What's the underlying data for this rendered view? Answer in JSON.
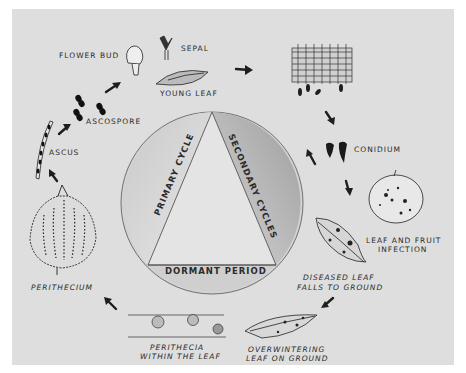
{
  "diagram": {
    "background": "#dedede",
    "ink": "#1e1e1e",
    "center": {
      "primary": "PRIMARY CYCLE",
      "secondary": "SECONDARY CYCLES",
      "dormant": "DORMANT PERIOD"
    },
    "stages": {
      "flower_bud": "FLOWER BUD",
      "sepal": "SEPAL",
      "young_leaf": "YOUNG LEAF",
      "ascospore": "ASCOSPORE",
      "ascus": "ASCUS",
      "perithecium": "PERITHECIUM",
      "perithecia_line1": "PERITHECIA",
      "perithecia_line2": "WITHIN THE LEAF",
      "overwintering_line1": "OVERWINTERING",
      "overwintering_line2": "LEAF ON GROUND",
      "diseased_line1": "DISEASED LEAF",
      "diseased_line2": "FALLS TO GROUND",
      "infection_line1": "LEAF AND FRUIT",
      "infection_line2": "INFECTION",
      "conidium": "CONIDIUM"
    }
  }
}
